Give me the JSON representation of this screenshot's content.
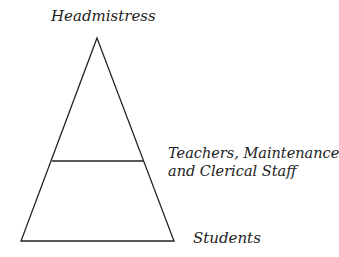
{
  "diagram": {
    "type": "pyramid",
    "labels": {
      "top": "Headmistress",
      "middle_line1": "Teachers, Maintenance",
      "middle_line2": "and Clerical Staff",
      "bottom": "Students"
    },
    "colors": {
      "stroke": "#222222",
      "background": "#ffffff"
    }
  }
}
